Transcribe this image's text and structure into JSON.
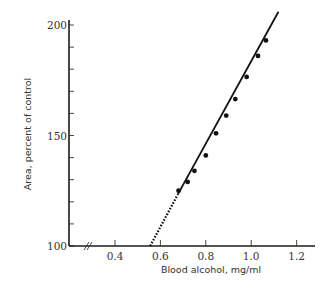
{
  "chart_data": {
    "type": "scatter",
    "title": "",
    "xlabel": "Blood alcohol, mg/ml",
    "ylabel": "Area, percent of control",
    "xlim": [
      0.3,
      1.28
    ],
    "ylim": [
      100,
      200
    ],
    "x_ticks": [
      0.4,
      0.6,
      0.8,
      1.0,
      1.2
    ],
    "x_tick_labels": [
      "0.4",
      "0.6",
      "0.8",
      "1.0",
      "1.2"
    ],
    "y_ticks_major": [
      100,
      150,
      200
    ],
    "y_tick_labels": [
      "100",
      "150",
      "200"
    ],
    "y_ticks_minor": [
      110,
      120,
      130,
      140,
      160,
      170,
      180,
      190
    ],
    "x_axis_break": true,
    "grid": false,
    "legend": null,
    "series": [
      {
        "name": "measurements",
        "marker": "filled-circle",
        "x": [
          0.68,
          0.72,
          0.75,
          0.8,
          0.845,
          0.89,
          0.93,
          0.98,
          1.03,
          1.065
        ],
        "y": [
          125,
          129,
          134,
          141,
          151,
          159,
          166.5,
          176.5,
          186,
          193
        ]
      }
    ],
    "fit_line": {
      "type": "linear",
      "solid_from": [
        0.675,
        123
      ],
      "solid_to": [
        1.12,
        206
      ],
      "dotted_extrapolation_from": [
        0.555,
        100
      ],
      "dotted_extrapolation_to": [
        0.675,
        123
      ]
    }
  },
  "layout": {
    "plot_px": {
      "x0_val": 0.4,
      "x0_px": 115,
      "px_per_x": 227,
      "y0_val": 100,
      "y0_px": 246,
      "px_per_y": 2.21
    },
    "colors": {
      "ink": "#111111",
      "text": "#333333",
      "background": "#ffffff"
    }
  }
}
